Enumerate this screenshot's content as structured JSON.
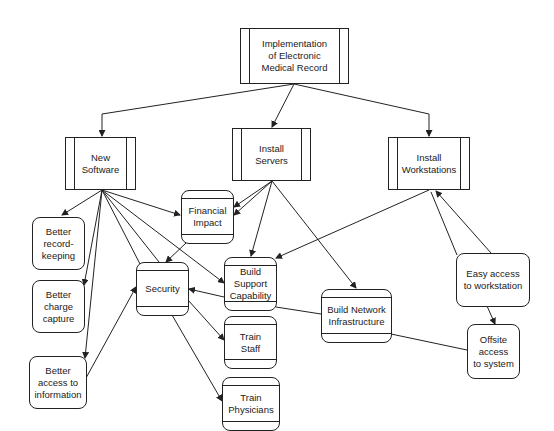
{
  "diagram": {
    "title": "Implementation of Electronic Medical Record",
    "nodes": [
      {
        "id": "emr",
        "label": "Implementation\nof Electronic\nMedical Record",
        "shape": "process"
      },
      {
        "id": "new_software",
        "label": "New\nSoftware",
        "shape": "process"
      },
      {
        "id": "install_servers",
        "label": "Install\nServers",
        "shape": "process"
      },
      {
        "id": "install_workstations",
        "label": "Install\nWorkstations",
        "shape": "process"
      },
      {
        "id": "financial_impact",
        "label": "Financial\nImpact",
        "shape": "rounded-banded"
      },
      {
        "id": "better_recordkeeping",
        "label": "Better\nrecord-\nkeeping",
        "shape": "rounded"
      },
      {
        "id": "better_charge_capture",
        "label": "Better\ncharge\ncapture",
        "shape": "rounded"
      },
      {
        "id": "better_access_info",
        "label": "Better\naccess to\ninformation",
        "shape": "rounded"
      },
      {
        "id": "security",
        "label": "Security",
        "shape": "rounded-banded"
      },
      {
        "id": "build_support",
        "label": "Build\nSupport\nCapability",
        "shape": "rounded-banded"
      },
      {
        "id": "train_staff",
        "label": "Train\nStaff",
        "shape": "rounded-banded"
      },
      {
        "id": "train_physicians",
        "label": "Train\nPhysicians",
        "shape": "rounded-banded"
      },
      {
        "id": "build_network",
        "label": "Build Network\nInfrastructure",
        "shape": "rounded-banded"
      },
      {
        "id": "easy_access",
        "label": "Easy access\nto workstation",
        "shape": "rounded"
      },
      {
        "id": "offsite_access",
        "label": "Offsite\naccess\nto system",
        "shape": "rounded"
      }
    ],
    "edges": [
      {
        "from": "emr",
        "to": "new_software"
      },
      {
        "from": "emr",
        "to": "install_servers"
      },
      {
        "from": "emr",
        "to": "install_workstations"
      },
      {
        "from": "new_software",
        "to": "better_recordkeeping"
      },
      {
        "from": "new_software",
        "to": "better_charge_capture"
      },
      {
        "from": "new_software",
        "to": "better_access_info"
      },
      {
        "from": "new_software",
        "to": "financial_impact"
      },
      {
        "from": "new_software",
        "to": "security"
      },
      {
        "from": "new_software",
        "to": "build_support"
      },
      {
        "from": "install_servers",
        "to": "financial_impact"
      },
      {
        "from": "install_servers",
        "to": "build_support"
      },
      {
        "from": "install_servers",
        "to": "build_network"
      },
      {
        "from": "install_workstations",
        "to": "build_support"
      },
      {
        "from": "easy_access",
        "to": "install_workstations"
      },
      {
        "from": "easy_access",
        "to": "offsite_access"
      },
      {
        "from": "financial_impact",
        "to": "security"
      },
      {
        "from": "better_access_info",
        "to": "security"
      },
      {
        "from": "build_support",
        "to": "security"
      },
      {
        "from": "security",
        "to": "train_staff"
      },
      {
        "from": "security",
        "to": "train_physicians"
      },
      {
        "from": "offsite_access",
        "to": "build_network"
      },
      {
        "from": "build_network",
        "to": "build_support"
      }
    ]
  }
}
